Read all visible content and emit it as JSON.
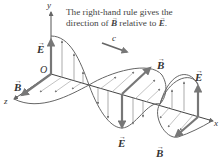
{
  "caption": {
    "line1": "The right-hand rule gives the",
    "line2_pre": "direction of ",
    "line2_b": "B",
    "line2_mid": " relative to ",
    "line2_e": "E",
    "line2_post": "."
  },
  "labels": {
    "y_axis": "y",
    "x_axis": "x",
    "z_axis": "z",
    "origin": "O",
    "speed": "c",
    "e_field": "E",
    "b_field": "B",
    "vector_arrow": "→"
  },
  "colors": {
    "axis": "#555555",
    "wave_curve": "#666666",
    "field_arrow": "#888888",
    "bold_vector": "#7a7a7a",
    "text": "#333333"
  }
}
